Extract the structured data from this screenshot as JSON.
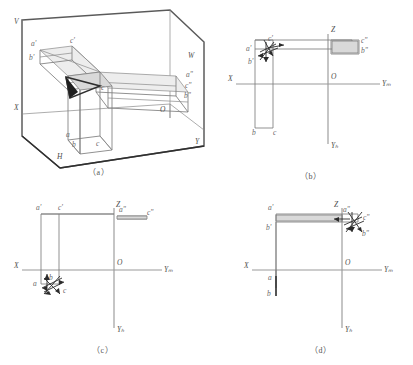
{
  "figure": {
    "kind": "engineering-drawing",
    "stroke_color": "#7d7d7d",
    "axis_color": "#9a9a9a",
    "arrow_color": "#2b2b2b",
    "background": "#ffffff"
  },
  "panels": [
    {
      "id": "a",
      "caption": "（a）",
      "plane_labels": [
        "V",
        "W",
        "X",
        "O",
        "H",
        "Y"
      ],
      "point_labels_front": [
        "a'",
        "c'",
        "b'"
      ],
      "point_labels_side": [
        "a\"",
        "c\"",
        "b\""
      ],
      "point_labels_top": [
        "a",
        "b",
        "c"
      ],
      "inner_label": "c"
    },
    {
      "id": "b",
      "caption": "（b）",
      "axis_labels": [
        "Z",
        "X",
        "O",
        "Yₘ",
        "Yₕ"
      ],
      "cluster_labels": [
        "a'",
        "b'",
        "c'"
      ],
      "right_labels": [
        "c\"",
        "b\""
      ],
      "bottom_labels": [
        "b",
        "c"
      ]
    },
    {
      "id": "c",
      "caption": "（c）",
      "axis_labels": [
        "Z",
        "X",
        "O",
        "Yₘ",
        "Yₕ"
      ],
      "top_left_labels": [
        "a'",
        "c'"
      ],
      "top_right_labels": [
        "a\"",
        "c\""
      ],
      "cluster_labels": [
        "a",
        "b",
        "c"
      ]
    },
    {
      "id": "d",
      "caption": "（d）",
      "axis_labels": [
        "Z",
        "X",
        "O",
        "Yₘ",
        "Yₕ"
      ],
      "left_labels": [
        "a'",
        "b'"
      ],
      "cluster_labels": [
        "a\"",
        "c\"",
        "b\""
      ],
      "bottom_labels": [
        "a",
        "b"
      ]
    }
  ]
}
